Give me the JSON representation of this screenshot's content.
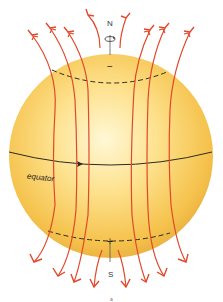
{
  "diagram": {
    "labels": {
      "north_pole": "N",
      "south_pole": "S",
      "north_polarity": "−",
      "south_polarity": "+",
      "equator": "equator",
      "figure_mark": "a"
    },
    "colors": {
      "sphere_center": "#fff6c8",
      "sphere_mid": "#fbd868",
      "sphere_edge": "#eeb43a",
      "field_lines": "#e2482a",
      "equator_line": "#2b2b1e",
      "latitude_dashes": "#2b2b1e"
    },
    "elements": [
      "rotation-arrow-north",
      "axis-line",
      "field-lines-upward-arrows",
      "field-lines-downward-arrows",
      "dashed-latitude-north",
      "dashed-latitude-south",
      "equator-with-arrow"
    ]
  }
}
